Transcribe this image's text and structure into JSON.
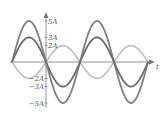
{
  "diagram": {
    "type": "sinusoidal-waveforms",
    "axes": {
      "x_label": "t",
      "y_ticks": [
        {
          "label": "5A",
          "value": 5
        },
        {
          "label": "3A",
          "value": 3
        },
        {
          "label": "2A",
          "value": 2
        },
        {
          "label": "−2A",
          "value": -2
        },
        {
          "label": "−3A",
          "value": -3
        },
        {
          "label": "−5A",
          "value": -5
        }
      ]
    },
    "series": [
      {
        "name": "5A sine",
        "amplitude": 5,
        "phase": "0",
        "color": "#808080"
      },
      {
        "name": "3A sine",
        "amplitude": 3,
        "phase": "0",
        "color": "#6e6e6e"
      },
      {
        "name": "2A inverted sine",
        "amplitude": 2,
        "phase": "180",
        "color": "#bdbdbd"
      }
    ],
    "cycles_shown": 2
  }
}
